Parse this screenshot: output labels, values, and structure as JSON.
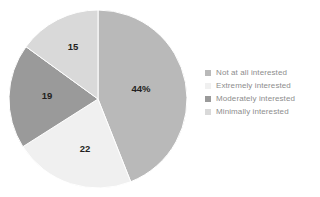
{
  "chart_data": {
    "type": "pie",
    "title": "",
    "subtitle": "",
    "xlabel": "",
    "ylabel": "",
    "grid": false,
    "legend_position": "right",
    "start_angle_deg": 0,
    "direction": "clockwise",
    "categories": [
      "Not at all interested",
      "Extremely interested",
      "Moderately interested",
      "Minimally interested"
    ],
    "values": [
      44,
      22,
      19,
      15
    ],
    "data_labels": [
      "44%",
      "22",
      "19",
      "15"
    ],
    "colors": [
      "#b9b9b9",
      "#f0f0f0",
      "#9a9a9a",
      "#d9d9d9"
    ],
    "slices": [
      {
        "label": "Not at all interested",
        "value": 44,
        "data_label": "44%",
        "color": "#b9b9b9",
        "start_deg": 0,
        "end_deg": 158.4,
        "label_x": 141,
        "label_y": 92
      },
      {
        "label": "Extremely interested",
        "value": 22,
        "data_label": "22",
        "color": "#f0f0f0",
        "start_deg": 158.4,
        "end_deg": 237.6,
        "label_x": 85,
        "label_y": 152
      },
      {
        "label": "Moderately interested",
        "value": 19,
        "data_label": "19",
        "color": "#9a9a9a",
        "start_deg": 237.6,
        "end_deg": 306.0,
        "label_x": 47,
        "label_y": 99
      },
      {
        "label": "Minimally interested",
        "value": 15,
        "data_label": "15",
        "color": "#d9d9d9",
        "start_deg": 306.0,
        "end_deg": 360.0,
        "label_x": 73,
        "label_y": 50
      }
    ],
    "geometry": {
      "center_x": 98,
      "center_y": 99,
      "radius": 89
    }
  },
  "legend": {
    "items": [
      {
        "label": "Not at all interested",
        "color": "#b9b9b9"
      },
      {
        "label": "Extremely interested",
        "color": "#f0f0f0"
      },
      {
        "label": "Moderately interested",
        "color": "#9a9a9a"
      },
      {
        "label": "Minimally interested",
        "color": "#d9d9d9"
      }
    ]
  }
}
